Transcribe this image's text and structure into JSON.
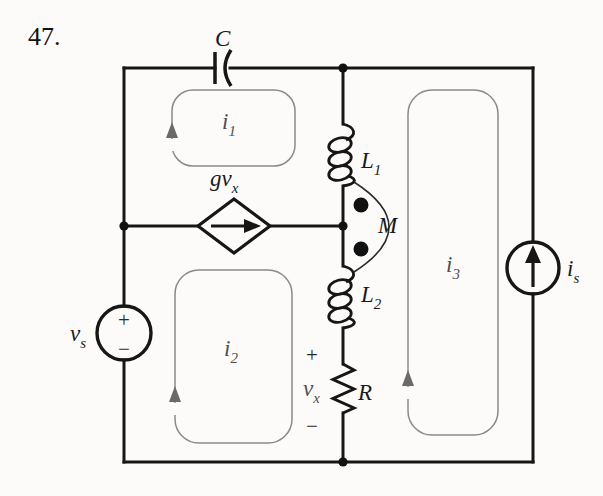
{
  "problem": {
    "number": "47."
  },
  "colors": {
    "wire": "#161616",
    "mesh_loop": "#8a8a8a",
    "mesh_arrow": "#6a6a6a",
    "label_text": "#1a1a1a",
    "background": "#fcfbf9"
  },
  "components": {
    "capacitor": {
      "name": "C"
    },
    "inductor_L1": {
      "name": "L",
      "sub": "1"
    },
    "inductor_L2": {
      "name": "L",
      "sub": "2"
    },
    "mutual_coupling": {
      "name": "M"
    },
    "resistor": {
      "name": "R"
    },
    "controlled_source": {
      "gain": "gv",
      "sub": "x"
    },
    "voltage_source": {
      "name": "v",
      "sub": "s",
      "polarity_plus": "+",
      "polarity_minus": "−"
    },
    "current_source": {
      "name": "i",
      "sub": "s"
    }
  },
  "voltage_vx": {
    "plus": "+",
    "name": "v",
    "sub": "x",
    "minus": "−"
  },
  "mesh_currents": {
    "i1": {
      "name": "i",
      "sub": "1"
    },
    "i2": {
      "name": "i",
      "sub": "2"
    },
    "i3": {
      "name": "i",
      "sub": "3"
    }
  }
}
